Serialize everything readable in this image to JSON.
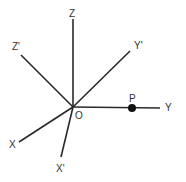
{
  "diagram": {
    "title": "",
    "origin": {
      "label": "O",
      "x": 73,
      "y": 107
    },
    "axes": [
      {
        "id": "z",
        "label": "Z",
        "x2": 73,
        "y2": 19,
        "label_x": 69,
        "label_y": 17
      },
      {
        "id": "zp",
        "label": "Z'",
        "x2": 21,
        "y2": 55,
        "label_x": 12,
        "label_y": 50
      },
      {
        "id": "yp",
        "label": "Y'",
        "x2": 130,
        "y2": 51,
        "label_x": 134,
        "label_y": 49
      },
      {
        "id": "y",
        "label": "Y",
        "x2": 160,
        "y2": 108,
        "label_x": 165,
        "label_y": 111
      },
      {
        "id": "x",
        "label": "X",
        "x2": 19,
        "y2": 142,
        "label_x": 9,
        "label_y": 148
      },
      {
        "id": "xp",
        "label": "X'",
        "x2": 61,
        "y2": 157,
        "label_x": 56,
        "label_y": 172
      }
    ],
    "point": {
      "label": "P",
      "x": 132,
      "y": 108,
      "r": 4,
      "label_x": 129,
      "label_y": 102
    },
    "colors": {
      "line": "#2a2a2a",
      "point": "#111111",
      "text": "#333333"
    }
  }
}
